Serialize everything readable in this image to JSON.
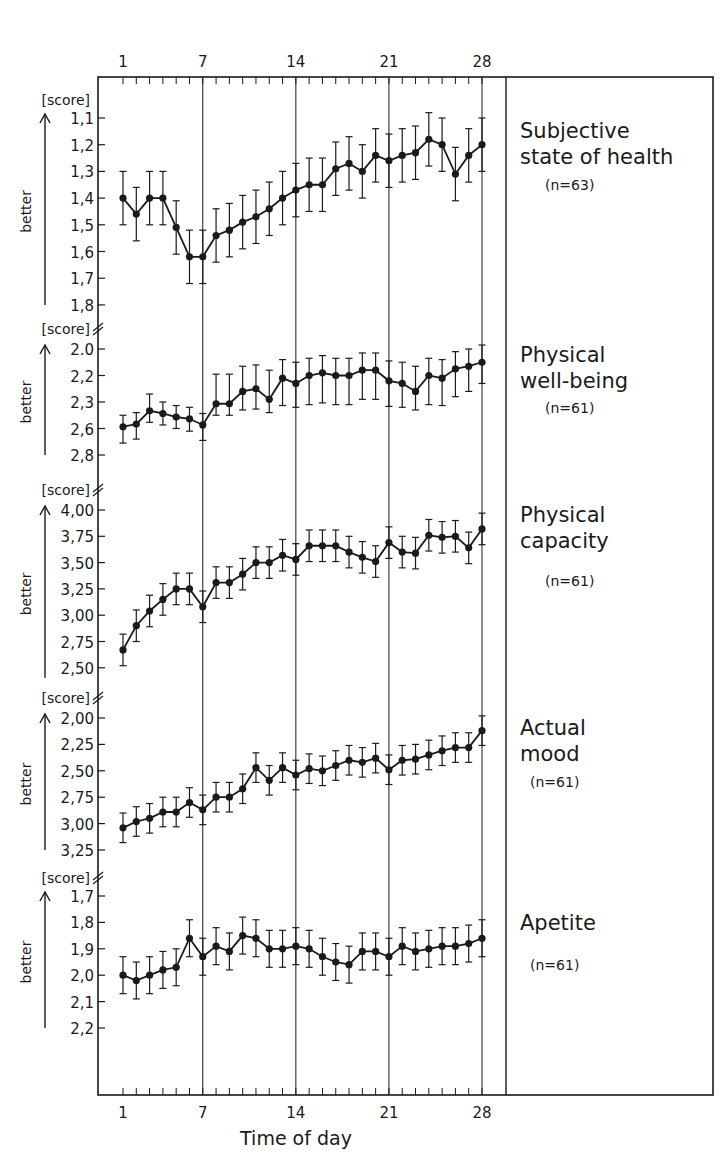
{
  "chart_data": {
    "type": "line",
    "xlabel": "Time of day",
    "x_tick_labels": [
      "1",
      "7",
      "14",
      "21",
      "28"
    ],
    "x_ticks": [
      1,
      7,
      14,
      21,
      28
    ],
    "x": [
      1,
      2,
      3,
      4,
      5,
      6,
      7,
      8,
      9,
      10,
      11,
      12,
      13,
      14,
      15,
      16,
      17,
      18,
      19,
      20,
      21,
      22,
      23,
      24,
      25,
      26,
      27,
      28
    ],
    "xlim": [
      1,
      28
    ],
    "grid": "vertical lines at days 7, 14, 21, 28",
    "axis_direction_label": "better",
    "unit_label": "[score]",
    "panels": [
      {
        "name": "Subjective state of health",
        "label_lines": [
          "Subjective",
          "state of health"
        ],
        "n_label": "(n=63)",
        "y_tick_labels": [
          "1,1",
          "1,2",
          "1,3",
          "1,4",
          "1,5",
          "1,6",
          "1,7",
          "1,8"
        ],
        "y_ticks": [
          1.1,
          1.2,
          1.3,
          1.4,
          1.5,
          1.6,
          1.7,
          1.8
        ],
        "ylim": [
          1.8,
          1.05
        ],
        "inverted": true,
        "error": 0.1,
        "values": [
          1.4,
          1.46,
          1.4,
          1.4,
          1.51,
          1.62,
          1.62,
          1.54,
          1.52,
          1.49,
          1.47,
          1.44,
          1.4,
          1.37,
          1.35,
          1.35,
          1.29,
          1.27,
          1.3,
          1.24,
          1.26,
          1.24,
          1.23,
          1.18,
          1.2,
          1.31,
          1.24,
          1.2
        ]
      },
      {
        "name": "Physical well-being",
        "label_lines": [
          "Physical",
          "well-being"
        ],
        "n_label": "(n=61)",
        "y_tick_labels": [
          "2.0",
          "2,2",
          "2,3",
          "2,6",
          "2,8"
        ],
        "y_ticks": [
          2.0,
          2.2,
          2.3,
          2.6,
          2.8
        ],
        "ylim": [
          2.8,
          1.95
        ],
        "inverted": true,
        "error": 0.13,
        "values": [
          2.58,
          2.55,
          2.4,
          2.43,
          2.47,
          2.49,
          2.56,
          2.32,
          2.32,
          2.26,
          2.25,
          2.29,
          2.21,
          2.23,
          2.2,
          2.18,
          2.2,
          2.2,
          2.16,
          2.16,
          2.22,
          2.23,
          2.26,
          2.2,
          2.21,
          2.15,
          2.13,
          2.1
        ]
      },
      {
        "name": "Physical capacity",
        "label_lines": [
          "Physical",
          "capacity"
        ],
        "n_label": "(n=61)",
        "y_tick_labels": [
          "4,00",
          "3,75",
          "3,50",
          "3,25",
          "3,00",
          "2,75",
          "2,50"
        ],
        "y_ticks": [
          4.0,
          3.75,
          3.5,
          3.25,
          3.0,
          2.75,
          2.5
        ],
        "ylim": [
          2.5,
          4.05
        ],
        "inverted": false,
        "error": 0.15,
        "values": [
          2.67,
          2.9,
          3.04,
          3.15,
          3.25,
          3.25,
          3.08,
          3.31,
          3.31,
          3.39,
          3.5,
          3.5,
          3.57,
          3.53,
          3.66,
          3.66,
          3.66,
          3.6,
          3.55,
          3.51,
          3.69,
          3.6,
          3.59,
          3.76,
          3.74,
          3.75,
          3.64,
          3.82
        ]
      },
      {
        "name": "Actual mood",
        "label_lines": [
          "Actual",
          "mood"
        ],
        "n_label": "(n=61)",
        "y_tick_labels": [
          "2,00",
          "2,25",
          "2,50",
          "2,75",
          "3,00",
          "3,25"
        ],
        "y_ticks": [
          2.0,
          2.25,
          2.5,
          2.75,
          3.0,
          3.25
        ],
        "ylim": [
          3.25,
          1.95
        ],
        "inverted": true,
        "error": 0.14,
        "values": [
          3.04,
          2.98,
          2.95,
          2.89,
          2.89,
          2.8,
          2.87,
          2.75,
          2.75,
          2.67,
          2.47,
          2.59,
          2.47,
          2.54,
          2.48,
          2.5,
          2.45,
          2.4,
          2.42,
          2.38,
          2.49,
          2.4,
          2.39,
          2.35,
          2.31,
          2.28,
          2.28,
          2.12
        ]
      },
      {
        "name": "Apetite",
        "label_lines": [
          "Apetite"
        ],
        "n_label": "(n=61)",
        "y_tick_labels": [
          "1,7",
          "1,8",
          "1,9",
          "2,0",
          "2,1",
          "2,2"
        ],
        "y_ticks": [
          1.7,
          1.8,
          1.9,
          2.0,
          2.1,
          2.2
        ],
        "ylim": [
          2.2,
          1.65
        ],
        "inverted": true,
        "error": 0.07,
        "values": [
          2.0,
          2.02,
          2.0,
          1.98,
          1.97,
          1.86,
          1.93,
          1.89,
          1.91,
          1.85,
          1.86,
          1.9,
          1.9,
          1.89,
          1.9,
          1.93,
          1.95,
          1.96,
          1.91,
          1.91,
          1.93,
          1.89,
          1.91,
          1.9,
          1.89,
          1.89,
          1.88,
          1.86
        ]
      }
    ]
  }
}
